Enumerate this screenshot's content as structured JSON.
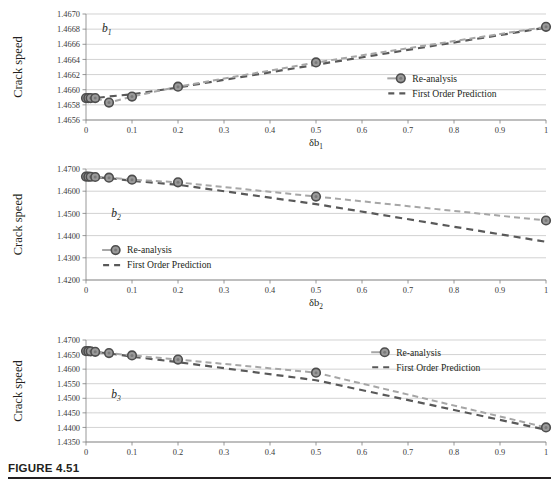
{
  "figure": {
    "caption_label": "FIGURE 4.51",
    "colors": {
      "reanalysis_line": "#a6a6a6",
      "prediction_line": "#595959",
      "marker_fill": "#9a9a9a",
      "marker_edge": "#4d4d4d",
      "gridline": "#bfbfbf",
      "axis": "#7f7f7f",
      "text": "#231f20"
    },
    "legend": {
      "reanalysis_label": "Re-analysis",
      "prediction_label": "First Order Prediction"
    }
  },
  "chart_data": [
    {
      "type": "line",
      "panel": "b1",
      "annotation": "b",
      "annotation_sub": "1",
      "title": "",
      "xlabel": "δb",
      "xlabel_sub": "1",
      "ylabel": "Crack speed",
      "xlim": [
        0,
        1
      ],
      "ylim": [
        1.4656,
        1.467
      ],
      "xticks": [
        "0",
        "0.1",
        "0.2",
        "0.3",
        "0.4",
        "0.5",
        "0.6",
        "0.7",
        "0.8",
        "0.9",
        "1"
      ],
      "xtick_values": [
        0,
        0.1,
        0.2,
        0.3,
        0.4,
        0.5,
        0.6,
        0.7,
        0.8,
        0.9,
        1
      ],
      "yticks": [
        "1.4656",
        "1.4658",
        "1.4660",
        "1.4662",
        "1.4664",
        "1.4666",
        "1.4668",
        "1.4670"
      ],
      "ytick_values": [
        1.4656,
        1.4658,
        1.466,
        1.4662,
        1.4664,
        1.4666,
        1.4668,
        1.467
      ],
      "grid": true,
      "legend_position": "center-right",
      "x": [
        0,
        0.005,
        0.01,
        0.02,
        0.05,
        0.1,
        0.2,
        0.5,
        1
      ],
      "series": [
        {
          "name": "Re-analysis",
          "markers": true,
          "values": [
            1.46589,
            1.46589,
            1.46589,
            1.46589,
            1.46583,
            1.46591,
            1.46604,
            1.46636,
            1.46683
          ]
        },
        {
          "name": "First Order Prediction",
          "markers": false,
          "values": [
            1.46587,
            1.46587,
            1.46588,
            1.46589,
            1.46591,
            1.46594,
            1.46603,
            1.46633,
            1.46682
          ]
        }
      ]
    },
    {
      "type": "line",
      "panel": "b2",
      "annotation": "b",
      "annotation_sub": "2",
      "title": "",
      "xlabel": "δb",
      "xlabel_sub": "2",
      "ylabel": "Crack speed",
      "xlim": [
        0,
        1
      ],
      "ylim": [
        1.42,
        1.47
      ],
      "xticks": [
        "0",
        "0.1",
        "0.2",
        "0.3",
        "0.4",
        "0.5",
        "0.6",
        "0.7",
        "0.8",
        "0.9",
        "1"
      ],
      "xtick_values": [
        0,
        0.1,
        0.2,
        0.3,
        0.4,
        0.5,
        0.6,
        0.7,
        0.8,
        0.9,
        1
      ],
      "yticks": [
        "1.4200",
        "1.4300",
        "1.4400",
        "1.4500",
        "1.4600",
        "1.4700"
      ],
      "ytick_values": [
        1.42,
        1.43,
        1.44,
        1.45,
        1.46,
        1.47
      ],
      "grid": true,
      "legend_position": "lower-left",
      "x": [
        0,
        0.005,
        0.01,
        0.02,
        0.05,
        0.1,
        0.2,
        0.5,
        1
      ],
      "series": [
        {
          "name": "Re-analysis",
          "markers": true,
          "values": [
            1.4666,
            1.46655,
            1.4665,
            1.4664,
            1.4661,
            1.4652,
            1.464,
            1.4576,
            1.4468
          ]
        },
        {
          "name": "First Order Prediction",
          "markers": false,
          "values": [
            1.4666,
            1.46652,
            1.46645,
            1.4663,
            1.4659,
            1.4647,
            1.4629,
            1.4542,
            1.4372
          ]
        }
      ]
    },
    {
      "type": "line",
      "panel": "b3",
      "annotation": "b",
      "annotation_sub": "3",
      "title": "",
      "xlabel": "δb",
      "xlabel_sub": "3",
      "ylabel": "Crack speed",
      "xlim": [
        0,
        1
      ],
      "ylim": [
        1.435,
        1.47
      ],
      "xticks": [
        "0",
        "0.1",
        "0.2",
        "0.3",
        "0.4",
        "0.5",
        "0.6",
        "0.7",
        "0.8",
        "0.9",
        "1"
      ],
      "xtick_values": [
        0,
        0.1,
        0.2,
        0.3,
        0.4,
        0.5,
        0.6,
        0.7,
        0.8,
        0.9,
        1
      ],
      "yticks": [
        "1.4350",
        "1.4400",
        "1.4450",
        "1.4500",
        "1.4550",
        "1.4600",
        "1.4650",
        "1.4700"
      ],
      "ytick_values": [
        1.435,
        1.44,
        1.445,
        1.45,
        1.455,
        1.46,
        1.465,
        1.47
      ],
      "grid": true,
      "legend_position": "upper-right",
      "x": [
        0,
        0.005,
        0.01,
        0.02,
        0.05,
        0.1,
        0.2,
        0.5,
        1
      ],
      "series": [
        {
          "name": "Re-analysis",
          "markers": true,
          "values": [
            1.4662,
            1.46615,
            1.4661,
            1.46595,
            1.4655,
            1.4647,
            1.4633,
            1.4588,
            1.44
          ]
        },
        {
          "name": "First Order Prediction",
          "markers": false,
          "values": [
            1.4662,
            1.46612,
            1.46605,
            1.4659,
            1.4654,
            1.4643,
            1.4624,
            1.4562,
            1.4392
          ]
        }
      ]
    }
  ]
}
